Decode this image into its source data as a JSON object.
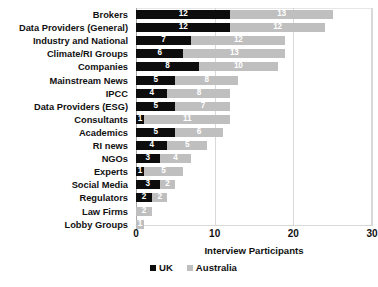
{
  "chart_data": {
    "type": "bar",
    "orientation": "horizontal",
    "stacked": true,
    "title": "",
    "xlabel": "Interview Participants",
    "ylabel": "",
    "xlim": [
      0,
      30
    ],
    "xticks": [
      0,
      10,
      20,
      30
    ],
    "grid": true,
    "legend_position": "bottom",
    "categories": [
      "Brokers",
      "Data Providers (General)",
      "Industry and National",
      "Climate/RI Groups",
      "Companies",
      "Mainstream News",
      "IPCC",
      "Data Providers (ESG)",
      "Consultants",
      "Academics",
      "RI news",
      "NGOs",
      "Experts",
      "Social Media",
      "Regulators",
      "Law Firms",
      "Lobby Groups"
    ],
    "series": [
      {
        "name": "UK",
        "color": "#0d0d0d",
        "values": [
          12,
          12,
          7,
          6,
          8,
          5,
          4,
          5,
          1,
          5,
          4,
          3,
          1,
          3,
          2,
          0,
          0
        ]
      },
      {
        "name": "Australia",
        "color": "#bfbfbf",
        "values": [
          13,
          12,
          12,
          13,
          10,
          8,
          8,
          7,
          11,
          6,
          5,
          4,
          5,
          2,
          2,
          2,
          1
        ]
      }
    ]
  },
  "legend": {
    "items": [
      {
        "label": "UK",
        "color": "#0d0d0d"
      },
      {
        "label": "Australia",
        "color": "#bfbfbf"
      }
    ]
  },
  "colors": {
    "uk": "#0d0d0d",
    "australia": "#bfbfbf",
    "gridline": "#d9d9d9",
    "text": "#111111",
    "background": "#ffffff"
  }
}
